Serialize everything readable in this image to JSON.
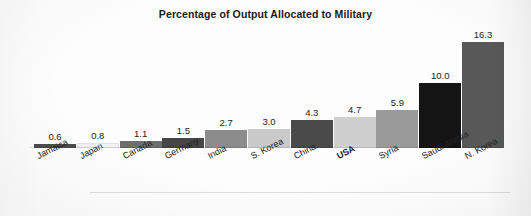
{
  "chart_data": {
    "type": "bar",
    "title": "Percentage of Output Allocated to Military",
    "xlabel": "",
    "ylabel": "",
    "ylim": [
      0,
      17
    ],
    "grid": false,
    "legend": "none",
    "orientation": "vertical",
    "value_labels_shown": true,
    "axis_ticks_shown": false,
    "categories": [
      "Jamaica",
      "Japan",
      "Canada",
      "Germany",
      "India",
      "S. Korea",
      "China",
      "USA",
      "Syria",
      "Saudi Arabia",
      "N. Korea"
    ],
    "values": [
      0.6,
      0.8,
      1.1,
      1.5,
      2.7,
      3.0,
      4.3,
      4.7,
      5.9,
      10.0,
      16.3
    ],
    "value_labels": [
      "0.6",
      "0.8",
      "1.1",
      "1.5",
      "2.7",
      "3.0",
      "4.3",
      "4.7",
      "5.9",
      "10.0",
      "16.3"
    ],
    "bar_colors": [
      "#4c4c4c",
      "#f2f2f2",
      "#6e6e6e",
      "#464646",
      "#8c8c8c",
      "#c9c9c9",
      "#4a4a4a",
      "#cfcfcf",
      "#9a9a9a",
      "#141414",
      "#585858"
    ],
    "emphasized_category": "USA"
  },
  "figure": {
    "background_color": "#fdfdfd",
    "title_color": "#1a1a1a",
    "label_color": "#222222"
  }
}
